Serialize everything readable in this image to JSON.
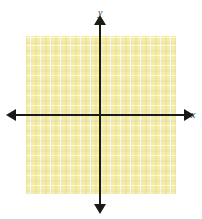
{
  "figure": {
    "name": "cartesian-coordinate-plane",
    "width": 202,
    "height": 219,
    "background_color": "#ffffff"
  },
  "axes": {
    "x_label": "x",
    "y_label": "y",
    "axis_color": "#1a1a17",
    "x_axis_pixel_y": 115,
    "y_axis_pixel_x": 100,
    "arrowheads": [
      "left",
      "right",
      "up",
      "down"
    ]
  },
  "grid": {
    "fill_color": "#f3ecaa",
    "line_color": "#ffffff",
    "cell_size_px": 10,
    "columns": 15,
    "rows": 16,
    "left_px": 26,
    "top_px": 36,
    "width_px": 150,
    "height_px": 158
  },
  "chart_data": {
    "type": "scatter",
    "title": "",
    "subtitle": "",
    "xlabel": "x",
    "ylabel": "y",
    "xlim": [
      -7.4,
      7.6
    ],
    "ylim": [
      -7.9,
      8.1
    ],
    "xticks": [
      -7,
      -6,
      -5,
      -4,
      -3,
      -2,
      -1,
      0,
      1,
      2,
      3,
      4,
      5,
      6,
      7
    ],
    "yticks": [
      -7,
      -6,
      -5,
      -4,
      -3,
      -2,
      -1,
      0,
      1,
      2,
      3,
      4,
      5,
      6,
      7
    ],
    "tick_labels_shown": false,
    "grid": true,
    "grid_spacing": 1,
    "legend": null,
    "legend_position": "none",
    "annotations": [],
    "series": [
      {
        "name": "empty-plot",
        "x": [],
        "y": []
      }
    ]
  }
}
